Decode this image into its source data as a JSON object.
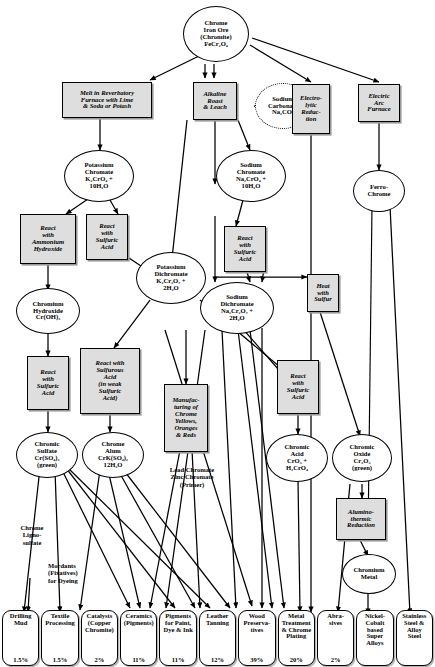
{
  "diagram": {
    "ink": "#000000",
    "box_fill": "#dedede",
    "node_fill": "#ffffff"
  },
  "nodes": {
    "ore": {
      "label": "Chrome Iron Ore (Chromite) FeCr2O4",
      "lines": [
        "Chrome",
        "Iron Ore",
        "(Chromite)",
        "FeCr₂O₄"
      ]
    },
    "melt": {
      "label": "Melt in Reverbatory Furnace with Lime & Soda or Potash",
      "lines": [
        "Melt in Reverbatory",
        "Furnace with Lime",
        "& Soda or Potash"
      ]
    },
    "alkaline": {
      "label": "Alkaline Roast & Leach",
      "lines": [
        "Alkaline",
        "Roast",
        "& Leach"
      ]
    },
    "sodcarb": {
      "label": "Sodium Carbonate Na2CO3",
      "lines": [
        "Sodium",
        "Carbonate",
        "Na₂CO₃"
      ]
    },
    "electro": {
      "label": "Electrolytic Reduction",
      "lines": [
        "Electro-",
        "lytic",
        "Reduc-",
        "tion"
      ]
    },
    "eaf": {
      "label": "Electric Arc Furnace",
      "lines": [
        "Electric",
        "Arc",
        "Furnace"
      ]
    },
    "kchromate": {
      "label": "Potassium Chromate K2CrO4 + 10H2O",
      "lines": [
        "Potassium",
        "Chromate",
        "K₂CrO₄ +",
        "10H₂O"
      ]
    },
    "nachromate": {
      "label": "Sodium Chromate Na2CrO4 + 10H2O",
      "lines": [
        "Sodium",
        "Chromate",
        "Na₂CrO₄ +",
        "10H₂O"
      ]
    },
    "ferro": {
      "label": "Ferro-Chrome",
      "lines": [
        "Ferro-",
        "Chrome"
      ]
    },
    "react_nh4": {
      "label": "React with Ammonium Hydroxide",
      "lines": [
        "React",
        "with",
        "Ammonium",
        "Hydroxide"
      ]
    },
    "react_h2so4_a": {
      "label": "React with Sulfuric Acid",
      "lines": [
        "React",
        "with",
        "Sulfuric",
        "Acid"
      ]
    },
    "react_h2so4_b": {
      "label": "React with Sulfuric Acid",
      "lines": [
        "React",
        "with",
        "Sulfuric",
        "Acid"
      ]
    },
    "kdichromate": {
      "label": "Potassium Dichromate K2Cr2O7 + 2H2O",
      "lines": [
        "Potassium",
        "Dichromate",
        "K₂Cr₂O₇ +",
        "2H₂O"
      ]
    },
    "nadichromate": {
      "label": "Sodium Dichromate Na2Cr2O7 + 2H2O",
      "lines": [
        "Sodium",
        "Dichromate",
        "Na₂Cr₂O₇ +",
        "2H₂O"
      ]
    },
    "crhydroxide": {
      "label": "Chromium Hydroxide Cr(OH)3",
      "lines": [
        "Chromium",
        "Hydroxide",
        "Cr(OH)₃"
      ]
    },
    "heat_s": {
      "label": "Heat with Sulfur",
      "lines": [
        "Heat",
        "with",
        "Sulfur"
      ]
    },
    "react_h2so4_c": {
      "label": "React with Sulfuric Acid",
      "lines": [
        "React",
        "with",
        "Sulfuric",
        "Acid"
      ]
    },
    "react_h2so3": {
      "label": "React with Sulfurous Acid (in weak Sulfuric Acid)",
      "lines": [
        "React with",
        "Sulfurous",
        "Acid",
        "(in weak",
        "Sulfuric",
        "Acid)"
      ]
    },
    "manufact": {
      "label": "Manufacturing of Chrome Yellows, Oranges & Reds",
      "lines": [
        "Manufac-",
        "turing of",
        "Chrome",
        "Yellows,",
        "Oranges",
        "& Reds"
      ]
    },
    "react_h2so4_d": {
      "label": "React with Sulfuric Acid",
      "lines": [
        "React",
        "with",
        "Sulfuric",
        "Acid"
      ]
    },
    "crsulfate": {
      "label": "Chromic Sulfate Cr(SO4)3 (green)",
      "lines": [
        "Chromic",
        "Sulfate",
        "Cr(SO₄)₃",
        "(green)"
      ]
    },
    "chromealum": {
      "label": "Chrome Alum CrK(SO4)2 12H2O",
      "lines": [
        "Chrome",
        "Alum",
        "CrK(SO₄)₂",
        "12H₂O"
      ]
    },
    "chromicacid": {
      "label": "Chromic Acid CrO3 + H2CrO4",
      "lines": [
        "Chromic",
        "Acid",
        "CrO₃ +",
        "H₂CrO₄"
      ]
    },
    "chromicoxide": {
      "label": "Chromic Oxide Cr2O3 (green)",
      "lines": [
        "Chromic",
        "Oxide",
        "Cr₂O₃",
        "(green)"
      ]
    },
    "alumino": {
      "label": "Alumino-thermic Reduction",
      "lines": [
        "Alumino-",
        "thermic",
        "Reduction"
      ]
    },
    "crmetal": {
      "label": "Chromium Metal",
      "lines": [
        "Chromium",
        "Metal"
      ]
    }
  },
  "labels": {
    "leadchromate": {
      "label": "Lead Chromate Zinc Chromate (Primer)",
      "lines": [
        "Lead Chromate",
        "Zinc Chromate",
        "(Primer)"
      ]
    },
    "lignosulfate": {
      "label": "Chrome Ligno-sulfate",
      "lines": [
        "Chrome",
        "Ligno-",
        "sulfate"
      ]
    },
    "mordants": {
      "label": "Mordants (Fixatives) for Dyeing",
      "lines": [
        "Mordants",
        "(Fixatives)",
        "for Dyeing"
      ]
    }
  },
  "uses": [
    {
      "id": "drilling",
      "lines": [
        "Drilling",
        "Mud"
      ],
      "pct": "1.5%"
    },
    {
      "id": "textile",
      "lines": [
        "Textile",
        "Processing"
      ],
      "pct": "1.5%"
    },
    {
      "id": "catalysts",
      "lines": [
        "Catalysts",
        "(Copper",
        "Chromite)"
      ],
      "pct": "2%"
    },
    {
      "id": "ceramics",
      "lines": [
        "Ceramics",
        "(Pigments)"
      ],
      "pct": "11%"
    },
    {
      "id": "pigments",
      "lines": [
        "Pigments",
        "for Paint,",
        "Dye & Ink"
      ],
      "pct": "11%"
    },
    {
      "id": "leather",
      "lines": [
        "Leather",
        "Tanning"
      ],
      "pct": "12%"
    },
    {
      "id": "wood",
      "lines": [
        "Wood",
        "Preserva-",
        "tives"
      ],
      "pct": "39%"
    },
    {
      "id": "metal",
      "lines": [
        "Metal",
        "Treatment",
        "& Chrome",
        "Plating"
      ],
      "pct": "20%"
    },
    {
      "id": "abrasives",
      "lines": [
        "Abra-",
        "sives"
      ],
      "pct": "2%"
    },
    {
      "id": "superalloy",
      "lines": [
        "Nickel-",
        "Cobalt",
        "based",
        "Super",
        "Alloys"
      ],
      "pct": ""
    },
    {
      "id": "stainless",
      "lines": [
        "Stainless",
        "Steel &",
        "Alloy",
        "Steel"
      ],
      "pct": ""
    }
  ]
}
